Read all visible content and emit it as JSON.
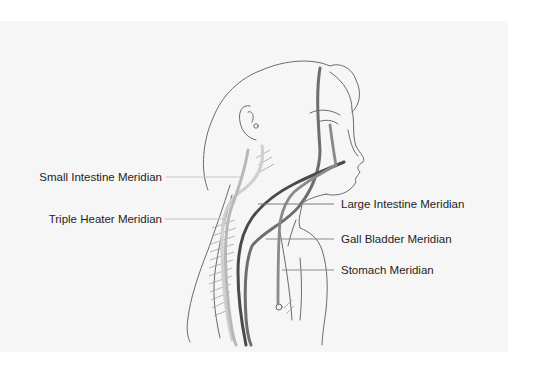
{
  "figure": {
    "background_panel_color": "#f6f6f6",
    "page_color": "#ffffff"
  },
  "labels": {
    "left": [
      {
        "id": "small-intestine",
        "text": "Small Intestine Meridian",
        "line_color": "#c8c8c8",
        "path_color": "#cfcfcf"
      },
      {
        "id": "triple-heater",
        "text": "Triple Heater Meridian",
        "line_color": "#c0c0c0",
        "path_color": "#b8b8b8"
      }
    ],
    "right": [
      {
        "id": "large-intestine",
        "text": "Large Intestine Meridian",
        "line_color": "#7a7a7a",
        "path_color": "#5a5a5a"
      },
      {
        "id": "gall-bladder",
        "text": "Gall Bladder Meridian",
        "line_color": "#8a8a8a",
        "path_color": "#6e6e6e"
      },
      {
        "id": "stomach",
        "text": "Stomach Meridian",
        "line_color": "#8c8c8c",
        "path_color": "#8a8a8a"
      }
    ]
  }
}
